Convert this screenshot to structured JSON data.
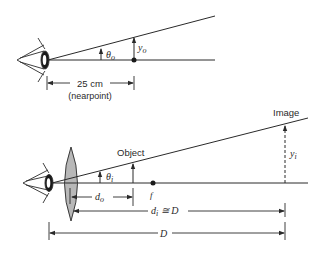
{
  "top_diagram": {
    "angle_label": "θ",
    "angle_sub": "o",
    "height_label": "y",
    "height_sub": "o",
    "distance_label": "25 cm",
    "distance_note": "(nearpoint)"
  },
  "bottom_diagram": {
    "object_label": "Object",
    "image_label": "Image",
    "angle_label": "θ",
    "angle_sub": "i",
    "image_height_label": "y",
    "image_height_sub": "i",
    "focus_label": "f",
    "do_label": "d",
    "do_sub": "o",
    "di_label": "d",
    "di_sub": "i",
    "di_approx": " ≅ D",
    "D_label": "D"
  },
  "colors": {
    "line": "#2a2a2a",
    "lens_fill": "#b8b8b8"
  }
}
